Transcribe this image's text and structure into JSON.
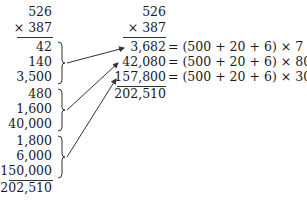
{
  "left_column": {
    "multiplicand": "526",
    "multiplier": "× 387",
    "partials": [
      "42",
      "140",
      "3,500",
      "480",
      "1,600",
      "40,000",
      "1,800",
      "6,000",
      "150,000"
    ],
    "total": "202,510"
  },
  "right_column": {
    "multiplicand": "526",
    "multiplier": "× 387",
    "rows": [
      {
        "value": "3,682",
        "expr": "= (500 + 20 + 6) × 7"
      },
      {
        "value": "42,080",
        "expr": "= (500 + 20 + 6) × 80"
      },
      {
        "value": "157,800",
        "expr": "= (500 + 20 + 6) × 300"
      }
    ],
    "total": "202,510"
  }
}
